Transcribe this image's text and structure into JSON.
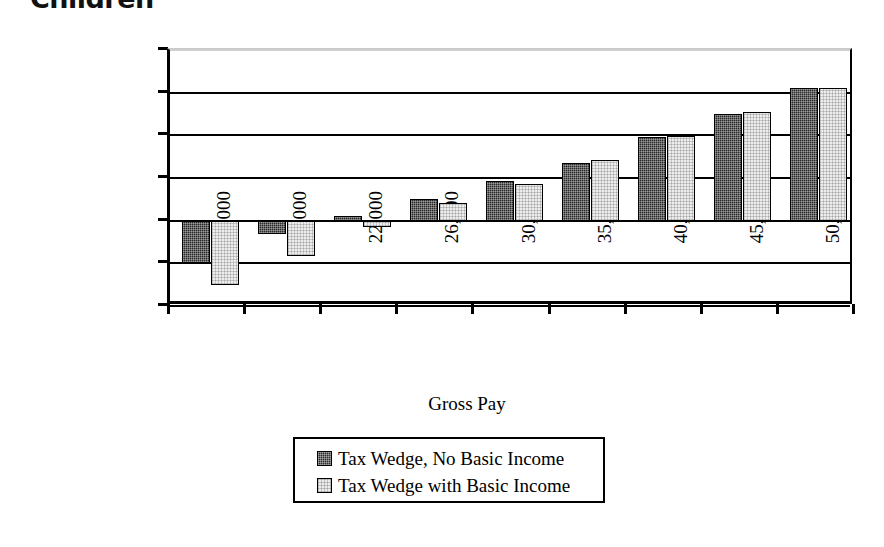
{
  "chart_data": {
    "type": "bar",
    "title": "Children",
    "xlabel": "Gross Pay",
    "ylabel": "Difference between Net and\nGross Job Costs",
    "categories": [
      "9,000",
      "15,000",
      "22,000",
      "26,000",
      "30,000",
      "35,000",
      "40,000",
      "45,000",
      "50,000"
    ],
    "series": [
      {
        "name": "Tax Wedge, No Basic Income",
        "swatch": "dark",
        "color": "#2a2a2a",
        "values": [
          -5000,
          -1600,
          500,
          2500,
          4650,
          6700,
          9750,
          12500,
          15500
        ]
      },
      {
        "name": "Tax Wedge with Basic Income",
        "swatch": "light",
        "color": "#ededed",
        "values": [
          -7500,
          -4200,
          -700,
          2100,
          4300,
          7150,
          9950,
          12750,
          15500
        ]
      }
    ],
    "ylim": [
      -10000,
      20000
    ],
    "yticks": [
      20000,
      15000,
      10000,
      5000,
      0,
      -5000,
      -10000
    ],
    "ytick_labels": [
      "20000",
      "15000",
      "10000",
      "5000",
      "0",
      "-5000",
      "-10000"
    ],
    "grid": true,
    "legend_position": "bottom-center"
  }
}
